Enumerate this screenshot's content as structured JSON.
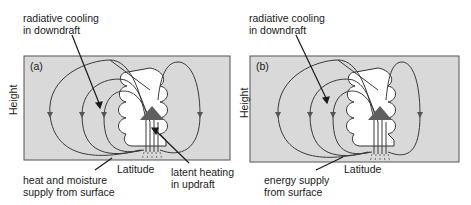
{
  "colors": {
    "panel_bg": "#d9d9d9",
    "line": "#3a3a3a",
    "triangle": "#5f5f5f",
    "arrowhead": "#555555",
    "cloud": "#ffffff"
  },
  "panels": [
    {
      "tag": "(a)",
      "y_axis_label": "Height",
      "x_axis_label": "Latitude",
      "annotations": {
        "top": [
          "radiative cooling",
          "in downdraft"
        ],
        "bottom_left": [
          "heat and moisture",
          "supply from surface"
        ],
        "bottom_right": [
          "latent heating",
          "in updraft"
        ]
      }
    },
    {
      "tag": "(b)",
      "y_axis_label": "Height",
      "x_axis_label": "Latitude",
      "annotations": {
        "top": [
          "radiative cooling",
          "in downdraft"
        ],
        "bottom_left": [
          "energy supply",
          "from surface"
        ]
      }
    }
  ]
}
